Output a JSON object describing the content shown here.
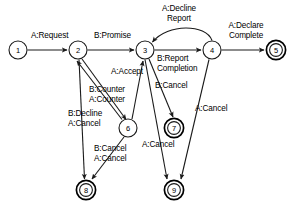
{
  "diagram": {
    "type": "finite-state-machine",
    "stroke_color": "#1a1a1a",
    "background_color": "#ffffff",
    "nodes": [
      {
        "id": "1",
        "label": "1",
        "x": 18,
        "y": 50,
        "accepting": false
      },
      {
        "id": "2",
        "label": "2",
        "x": 78,
        "y": 50,
        "accepting": false
      },
      {
        "id": "3",
        "label": "3",
        "x": 145,
        "y": 50,
        "accepting": false
      },
      {
        "id": "4",
        "label": "4",
        "x": 212,
        "y": 50,
        "accepting": false
      },
      {
        "id": "5",
        "label": "5",
        "x": 276,
        "y": 50,
        "accepting": true
      },
      {
        "id": "6",
        "label": "6",
        "x": 128,
        "y": 128,
        "accepting": false
      },
      {
        "id": "7",
        "label": "7",
        "x": 174,
        "y": 128,
        "accepting": true
      },
      {
        "id": "8",
        "label": "8",
        "x": 86,
        "y": 190,
        "accepting": true
      },
      {
        "id": "9",
        "label": "9",
        "x": 174,
        "y": 190,
        "accepting": true
      }
    ],
    "edges": [
      {
        "id": "e1",
        "from": "1",
        "to": "2",
        "label": "A:Request"
      },
      {
        "id": "e2",
        "from": "2",
        "to": "3",
        "label": "B:Promise"
      },
      {
        "id": "e3",
        "from": "3",
        "to": "4",
        "label": "B:Report\nCompletion"
      },
      {
        "id": "e4",
        "from": "4",
        "to": "5",
        "label": "A:Declare\nComplete"
      },
      {
        "id": "e5",
        "from": "4",
        "to": "3",
        "label": "A:Decline\nReport"
      },
      {
        "id": "e6",
        "from": "2",
        "to": "6",
        "label": "B:Counter\nA:Counter"
      },
      {
        "id": "e7",
        "from": "6",
        "to": "2",
        "label": "B:Counter\nA:Counter"
      },
      {
        "id": "e8",
        "from": "6",
        "to": "3",
        "label": "A:Accept"
      },
      {
        "id": "e9",
        "from": "2",
        "to": "8",
        "label": "B:Decline\nA:Cancel"
      },
      {
        "id": "e10",
        "from": "6",
        "to": "8",
        "label": "B:Cancel\nA:Cancel"
      },
      {
        "id": "e11",
        "from": "3",
        "to": "7",
        "label": "B:Cancel"
      },
      {
        "id": "e12",
        "from": "4",
        "to": "9",
        "label": "A:Cancel"
      },
      {
        "id": "e13",
        "from": "3",
        "to": "9",
        "label": "A:Cancel"
      }
    ],
    "labels": [
      {
        "id": "lbl-a-request",
        "text": "A:Request",
        "x": 31,
        "y": 31,
        "align": "lft"
      },
      {
        "id": "lbl-b-promise",
        "text": "B:Promise",
        "x": 94,
        "y": 31,
        "align": "lft"
      },
      {
        "id": "lbl-a-decline-report",
        "text": "A:Decline\nReport",
        "x": 155,
        "y": 4,
        "align": "ctr"
      },
      {
        "id": "lbl-a-declare-complete",
        "text": "A:Declare\nComplete",
        "x": 221,
        "y": 21,
        "align": "ctr"
      },
      {
        "id": "lbl-b-report-completion",
        "text": "B:Report\nCompletion",
        "x": 157,
        "y": 54,
        "align": "lft"
      },
      {
        "id": "lbl-a-accept",
        "text": "A:Accept",
        "x": 111,
        "y": 67,
        "align": "lft"
      },
      {
        "id": "lbl-b-counter-a-counter",
        "text": "B:Counter\nA:Counter",
        "x": 89,
        "y": 85,
        "align": "lft"
      },
      {
        "id": "lbl-b-cancel-top",
        "text": "B:Cancel",
        "x": 155,
        "y": 81,
        "align": "lft"
      },
      {
        "id": "lbl-a-cancel-right",
        "text": "A:Cancel",
        "x": 195,
        "y": 104,
        "align": "lft"
      },
      {
        "id": "lbl-b-decline-a-cancel",
        "text": "B:Decline\nA:Cancel",
        "x": 68,
        "y": 109,
        "align": "lft"
      },
      {
        "id": "lbl-b-cancel-a-cancel",
        "text": "B:Cancel\nA:Cancel",
        "x": 94,
        "y": 144,
        "align": "lft"
      },
      {
        "id": "lbl-a-cancel-mid",
        "text": "A:Cancel",
        "x": 142,
        "y": 140,
        "align": "lft"
      }
    ]
  }
}
